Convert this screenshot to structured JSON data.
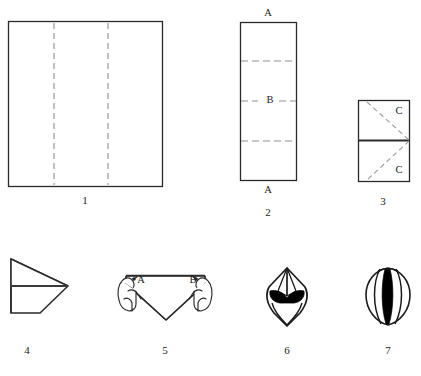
{
  "figure": {
    "background_color": "#ffffff",
    "line_color": "#1a1a1a",
    "dashed_line_color": "#8a8a8a",
    "fill_color": "#000000",
    "width": 421,
    "height": 376
  },
  "steps": [
    {
      "number": "1",
      "caption": "1",
      "caption_x": 85,
      "caption_y": 195,
      "description": "Square sheet with two vertical dashed fold lines dividing it into thirds"
    },
    {
      "number": "2",
      "caption": "2",
      "caption_x": 268,
      "caption_y": 207,
      "description": "Folded vertical strip with three horizontal dashed fold lines"
    },
    {
      "number": "3",
      "caption": "3",
      "caption_x": 383,
      "caption_y": 196,
      "description": "Small rectangle halved by a horizontal crease with diagonal dashed folds"
    },
    {
      "number": "4",
      "caption": "4",
      "caption_x": 27,
      "caption_y": 345,
      "description": "Arrow-like triangular form pointing right with a central horizontal crease"
    },
    {
      "number": "5",
      "caption": "5",
      "caption_x": 165,
      "caption_y": 345,
      "description": "Two hands pulling corners A and B downward into a V shape"
    },
    {
      "number": "6",
      "caption": "6",
      "caption_x": 287,
      "caption_y": 345,
      "description": "Pointed bud shape with dark shaded band"
    },
    {
      "number": "7",
      "caption": "7",
      "caption_x": 388,
      "caption_y": 345,
      "description": "Finished rounded tulip with vertical petal creases"
    }
  ],
  "point_labels": [
    {
      "id": "step2-top-a",
      "text": "A",
      "x": 268,
      "y": 13
    },
    {
      "id": "step2-middle-b",
      "text": "B",
      "x": 270,
      "y": 100
    },
    {
      "id": "step2-bottom-a",
      "text": "A",
      "x": 268,
      "y": 190
    },
    {
      "id": "step3-top-c",
      "text": "C",
      "x": 399,
      "y": 111
    },
    {
      "id": "step3-bottom-c",
      "text": "C",
      "x": 399,
      "y": 170
    },
    {
      "id": "step5-label-a",
      "text": "A",
      "x": 141,
      "y": 280
    },
    {
      "id": "step5-label-b",
      "text": "B",
      "x": 193,
      "y": 280
    }
  ]
}
